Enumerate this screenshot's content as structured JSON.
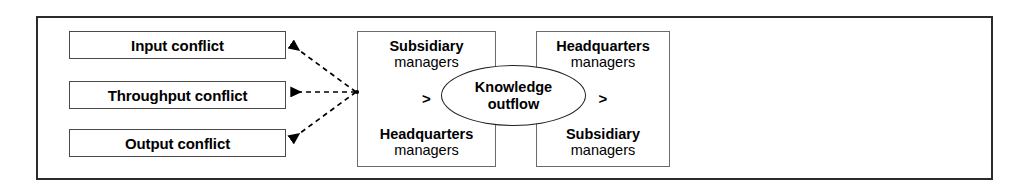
{
  "figure": {
    "frame_color": "#2b2b2b",
    "box_border_color": "#4a4a4a",
    "text_color": "#000000",
    "arrow_style": "dashed"
  },
  "conflicts": [
    {
      "label": "Input conflict"
    },
    {
      "label": "Throughput conflict"
    },
    {
      "label": "Output conflict"
    }
  ],
  "flows": [
    {
      "source_line1": "Subsidiary",
      "source_line2": "managers",
      "operator": ">",
      "target_line1": "Headquarters",
      "target_line2": "managers"
    },
    {
      "source_line1": "Headquarters",
      "source_line2": "managers",
      "operator": ">",
      "target_line1": "Subsidiary",
      "target_line2": "managers"
    }
  ],
  "ellipse": {
    "line1": "Knowledge",
    "line2": "outflow"
  },
  "connectors": [
    {
      "name": "arrow-to-input-conflict"
    },
    {
      "name": "arrow-to-throughput-conflict"
    },
    {
      "name": "arrow-to-output-conflict"
    }
  ]
}
